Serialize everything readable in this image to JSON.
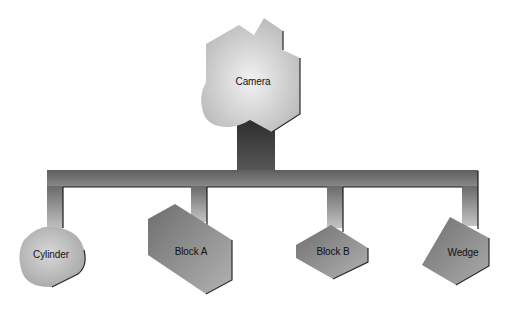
{
  "diagram": {
    "type": "hierarchy",
    "root": {
      "id": "camera",
      "label": "Camera"
    },
    "children": [
      {
        "id": "cylinder",
        "label": "Cylinder"
      },
      {
        "id": "block-a",
        "label": "Block A"
      },
      {
        "id": "block-b",
        "label": "Block B"
      },
      {
        "id": "wedge",
        "label": "Wedge"
      }
    ],
    "edges": [
      [
        "Camera",
        "Cylinder"
      ],
      [
        "Camera",
        "Block A"
      ],
      [
        "Camera",
        "Block B"
      ],
      [
        "Camera",
        "Wedge"
      ]
    ]
  },
  "colors": {
    "connector_dark": "#3a3a3a",
    "connector_light": "#a8a8a8",
    "node_light": "#dcdcdc",
    "node_mid": "#9a9a9a",
    "node_dark": "#5a5a5a",
    "background": "#ffffff"
  }
}
